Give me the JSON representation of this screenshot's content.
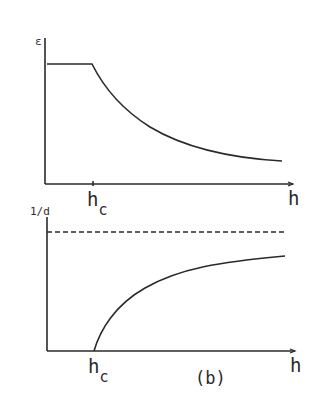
{
  "figure": {
    "panel_label": "(b)",
    "top_plot": {
      "y_axis_label": "ε",
      "x_axis_label": "h",
      "tick_label_main": "h",
      "tick_label_sub": "c",
      "curve": "constant plateau for h < h_c, then decaying toward an asymptote for h > h_c"
    },
    "bottom_plot": {
      "y_axis_label": "1/d",
      "x_axis_label": "h",
      "tick_label_main": "h",
      "tick_label_sub": "c",
      "curve": "zero at h_c, rising and saturating below the dashed asymptote",
      "dashed_line": "horizontal asymptote"
    },
    "colors": {
      "ink": "#2a2a2a",
      "background": "#ffffff"
    }
  }
}
